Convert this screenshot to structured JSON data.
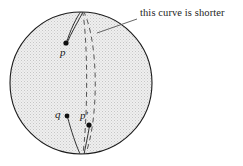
{
  "figure": {
    "kind": "sphere-geodesic-diagram",
    "width": 243,
    "height": 166,
    "background_color": "#ffffff"
  },
  "sphere": {
    "name": "sphere",
    "center_x": 81,
    "center_y": 83,
    "radius": 71,
    "fill_color": "#e9e9e9",
    "stroke_color": "#1a1a1a",
    "stroke_width": 1.1,
    "texture": "stipple"
  },
  "points": [
    {
      "id": "p",
      "label": "p",
      "dot_x": 66,
      "dot_y": 43,
      "label_x": 60,
      "label_y": 47,
      "dot_radius": 2.6,
      "color": "#111111"
    },
    {
      "id": "q",
      "label": "q",
      "dot_x": 67,
      "dot_y": 116,
      "label_x": 55,
      "label_y": 109,
      "dot_radius": 2.4,
      "color": "#111111"
    },
    {
      "id": "p-prime",
      "label": "p'",
      "dot_x": 89,
      "dot_y": 125,
      "label_x": 80,
      "label_y": 110,
      "dot_radius": 2.6,
      "color": "#111111"
    }
  ],
  "annotation": {
    "text": "this curve is shorter",
    "text_x": 140,
    "text_y": 8,
    "leader_from_x": 137,
    "leader_from_y": 19,
    "leader_to_x": 97,
    "leader_to_y": 33,
    "color": "#242424"
  },
  "curves": {
    "solid_color": "#333333",
    "dashed_color": "#555555",
    "solid_width": 1.0,
    "dashed_width": 1.0,
    "dash_pattern": "5,4",
    "solid_upper_pair": [
      "M 81.5 10.5 C 76 18 70 31 66.5 42.5",
      "M 83.5 11.0 C 79 20 71 33 67.0 43.0"
    ],
    "solid_lower_pair": [
      "M 67.5 117 C 71 130 76 146 81.5 157",
      "M 89.5 126 C 88 136 85 148 83.5 157.5"
    ],
    "dashed_left": "M 82.5 11 C 88 40 88 120 82.5 157",
    "dashed_right": "M 83.5 11 C 99 42 99 122 84.5 157"
  },
  "colors": {
    "ink": "#1a1a1a",
    "sphere_fill": "#e9e9e9",
    "paper": "#ffffff"
  }
}
